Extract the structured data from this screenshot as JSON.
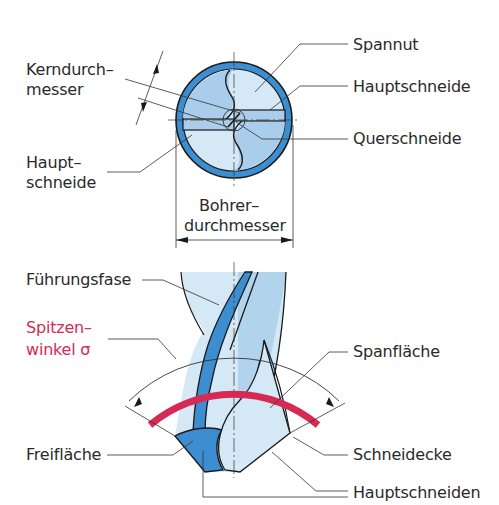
{
  "figure": {
    "title_fragment": "",
    "colors": {
      "outline": "#1a1a1a",
      "body_light": "#d4e8f6",
      "body_mid": "#a9cdea",
      "margin_blue": "#3d8ed0",
      "margin_dark": "#2470b3",
      "accent_red": "#d62a55",
      "leader": "#333333"
    },
    "cross_section": {
      "labels": {
        "kerndurchmesser_line1": "Kerndurch–",
        "kerndurchmesser_line2": "messer",
        "spannut": "Spannut",
        "hauptschneide_right": "Hauptschneide",
        "querschneide": "Querschneide",
        "hauptschneide_left_line1": "Haupt–",
        "hauptschneide_left_line2": "schneide",
        "bohrerdurchmesser_line1": "Bohrer–",
        "bohrerdurchmesser_line2": "durchmesser"
      }
    },
    "side_view": {
      "labels": {
        "fuehrungsfase": "Führungsfase",
        "spitzenwinkel_line1": "Spitzen–",
        "spitzenwinkel_line2": "winkel σ",
        "spanflaeche": "Spanfläche",
        "freiflaeche": "Freifläche",
        "schneidecke": "Schneidecke",
        "hauptschneiden": "Hauptschneiden"
      }
    }
  }
}
